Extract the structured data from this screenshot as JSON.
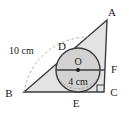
{
  "figure": {
    "kind": "geometry-diagram",
    "colors": {
      "stroke": "#3c3c3c",
      "triangle_fill": "#e3e3e3",
      "circle_fill": "#d2d2d2",
      "dashed_stroke": "#9a9a9a",
      "text": "#1a1a1a",
      "background": "#ffffff"
    },
    "vertices": [
      {
        "name": "A",
        "label": "A",
        "x": 107,
        "y": 20
      },
      {
        "name": "B",
        "label": "B",
        "x": 24,
        "y": 92
      },
      {
        "name": "C",
        "label": "C",
        "x": 104,
        "y": 92
      }
    ],
    "tangent_points": [
      {
        "name": "D",
        "label": "D",
        "x": 68,
        "y": 53
      },
      {
        "name": "E",
        "label": "E",
        "x": 78,
        "y": 92
      },
      {
        "name": "F",
        "label": "F",
        "x": 104,
        "y": 70
      }
    ],
    "circle": {
      "center_label": "O",
      "cx": 78,
      "cy": 70,
      "r": 22
    },
    "labels": [
      {
        "name": "side-bd-length",
        "text": "10 cm",
        "x": 10,
        "y": 50
      },
      {
        "name": "circle-diameter",
        "text": "4 cm",
        "x": 63,
        "y": 82
      }
    ],
    "right_angle": {
      "at": "C",
      "size": 7
    },
    "arc": {
      "name": "radius-arc-from-b",
      "dashed": true
    }
  }
}
